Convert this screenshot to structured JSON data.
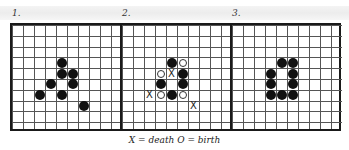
{
  "figure": {
    "caption": "X = death  O = birth",
    "grid": {
      "cols_per_panel": 10,
      "rows": 10
    },
    "panels": [
      {
        "label": "1.",
        "live": [
          [
            4,
            3
          ],
          [
            4,
            4
          ],
          [
            5,
            4
          ],
          [
            3,
            5
          ],
          [
            5,
            5
          ],
          [
            2,
            6
          ],
          [
            4,
            6
          ],
          [
            6,
            7
          ]
        ],
        "birth": [],
        "death": []
      },
      {
        "label": "2.",
        "live": [
          [
            4,
            3
          ],
          [
            5,
            4
          ],
          [
            3,
            5
          ],
          [
            5,
            5
          ],
          [
            4,
            6
          ]
        ],
        "birth": [
          [
            5,
            3
          ],
          [
            3,
            4
          ],
          [
            3,
            6
          ],
          [
            5,
            6
          ]
        ],
        "death": [
          [
            4,
            4
          ],
          [
            2,
            6
          ],
          [
            6,
            7
          ]
        ]
      },
      {
        "label": "3.",
        "live": [
          [
            4,
            3
          ],
          [
            5,
            3
          ],
          [
            3,
            4
          ],
          [
            5,
            4
          ],
          [
            3,
            5
          ],
          [
            5,
            5
          ],
          [
            3,
            6
          ],
          [
            4,
            6
          ],
          [
            5,
            6
          ]
        ],
        "birth": [],
        "death": []
      }
    ],
    "symbols": {
      "death": "X",
      "birth": "O"
    }
  }
}
